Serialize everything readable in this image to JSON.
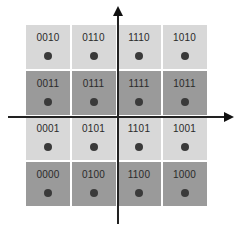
{
  "diagram": {
    "type": "16-QAM constellation with Gray-coded labels",
    "colors": {
      "light_cell": "#d8d8d8",
      "dark_cell": "#9a9a9a",
      "dot": "#3a3a3a",
      "axis": "#222222"
    },
    "rows": [
      {
        "shade": "light",
        "labels": [
          "0010",
          "0110",
          "1110",
          "1010"
        ]
      },
      {
        "shade": "dark",
        "labels": [
          "0011",
          "0111",
          "1111",
          "1011"
        ]
      },
      {
        "shade": "light",
        "labels": [
          "0001",
          "0101",
          "1101",
          "1001"
        ]
      },
      {
        "shade": "dark",
        "labels": [
          "0000",
          "0100",
          "1100",
          "1000"
        ]
      }
    ],
    "axes": {
      "vertical": "arrow-up",
      "horizontal": "arrow-right"
    }
  }
}
